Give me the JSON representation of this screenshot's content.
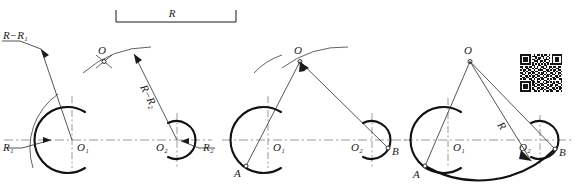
{
  "figure": {
    "type": "engineering-construction-drawing",
    "background_color": "#ffffff",
    "line_color": "#1a1a1a",
    "centerline_color": "#8e8e8e"
  },
  "dimension": {
    "label": "R",
    "style": "bracket-dimension",
    "x1": 116,
    "x2": 236,
    "y": 18
  },
  "steps": [
    {
      "name": "step-1-locate-center",
      "labels": {
        "radius_minus_r1": "R−R₁",
        "radius_minus_r2": "R−R₂",
        "center_o": "O",
        "center_o1": "O₁",
        "center_o2": "O₂",
        "radius_r1": "R₁",
        "radius_r2": "R₂"
      },
      "circle1": {
        "cx": 72,
        "cy": 140,
        "r": 33
      },
      "circle2": {
        "cx": 177,
        "cy": 140,
        "r": 19
      },
      "point_o": {
        "x": 104,
        "y": 61
      }
    },
    {
      "name": "step-2-mark-tangent-points",
      "labels": {
        "center_o": "O",
        "center_o1": "O₁",
        "center_o2": "O₂",
        "point_a": "A",
        "point_b": "B"
      },
      "circle1": {
        "cx": 268,
        "cy": 140,
        "r": 33
      },
      "circle2": {
        "cx": 372,
        "cy": 140,
        "r": 19
      },
      "point_o": {
        "x": 300,
        "y": 61
      },
      "point_a": {
        "x": 246,
        "y": 165
      },
      "point_b": {
        "x": 388,
        "y": 148
      }
    },
    {
      "name": "step-3-draw-arc",
      "labels": {
        "center_o": "O",
        "center_o1": "O₁",
        "center_o2": "O₂",
        "point_a": "A",
        "point_b": "B",
        "radius_r": "R"
      },
      "circle1": {
        "cx": 448,
        "cy": 140,
        "r": 33
      },
      "circle2": {
        "cx": 540,
        "cy": 140,
        "r": 19
      },
      "point_o": {
        "x": 470,
        "y": 61
      },
      "point_a": {
        "x": 425,
        "y": 166
      },
      "point_b": {
        "x": 555,
        "y": 149
      }
    }
  ],
  "qr_code": {
    "name": "qr-code",
    "x": 520,
    "y": 54,
    "size": 42,
    "modules": 25,
    "dark": "#151515",
    "light": "#ffffff",
    "bits": [
      "1111111001011010110101111111",
      "1000001011100011001001000001",
      "1011101000101101010101011101",
      "1011101011011000111001011101",
      "1011101001110110100101011101",
      "1000001010010101011001000001",
      "1111111010101010101011111111",
      "0000000011001100110000000000",
      "1101101101010011010110110110",
      "0100110010110101100101001100",
      "1011011001001110011010110110",
      "0010100110110001101100101001",
      "1101011011001011010011010110",
      "0110010100110110101101100101",
      "1001101011011001011010011010",
      "0110110010100110110001101100",
      "1011001101011011001010110011",
      "0000000110010100110100000001",
      "1111111011011001011010101101",
      "1000001010100110110001100110",
      "1011101011011011001011011001",
      "1011101001100100110110010110",
      "1011101010011011011001101011",
      "1000001011010110100110110010",
      "1111111001101001011011001101"
    ]
  }
}
